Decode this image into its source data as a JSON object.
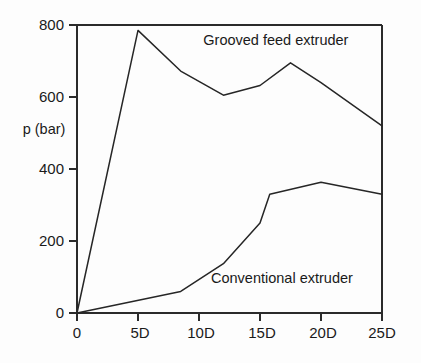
{
  "chart_data": {
    "type": "line",
    "title": "",
    "subtitle": "",
    "xlabel": "",
    "ylabel": "p (bar)",
    "xlim": [
      0,
      25
    ],
    "ylim": [
      0,
      800
    ],
    "grid": false,
    "legend_position": "inline-annotation",
    "x_tick_labels": [
      "0",
      "5D",
      "10D",
      "15D",
      "20D",
      "25D"
    ],
    "x_tick_values": [
      0,
      5,
      10,
      15,
      20,
      25
    ],
    "y_tick_labels": [
      "0",
      "200",
      "400",
      "600",
      "800"
    ],
    "y_tick_values": [
      0,
      200,
      400,
      600,
      800
    ],
    "series": [
      {
        "name": "Grooved feed extruder",
        "x": [
          0,
          5,
          8.5,
          12,
          15,
          17.5,
          20,
          25
        ],
        "values": [
          0,
          785,
          672,
          605,
          632,
          695,
          640,
          520
        ]
      },
      {
        "name": "Conventional extruder",
        "x": [
          0,
          8.5,
          12,
          15,
          15.8,
          20,
          25
        ],
        "values": [
          0,
          60,
          137,
          250,
          330,
          363,
          330
        ]
      }
    ],
    "annotations": [
      {
        "text": "Grooved feed extruder",
        "x": 16.3,
        "y": 745
      },
      {
        "text": "Conventional extruder",
        "x": 16.8,
        "y": 82
      }
    ],
    "colors": {
      "line": "#262626",
      "axis": "#2b2b2b",
      "background": "#fdfdfd",
      "text": "#1a1a1a"
    }
  },
  "axes": {
    "y_axis_title": "p (bar)",
    "y_ticks": [
      {
        "label": "800",
        "value": 800
      },
      {
        "label": "600",
        "value": 600
      },
      {
        "label": "400",
        "value": 400
      },
      {
        "label": "200",
        "value": 200
      },
      {
        "label": "0",
        "value": 0
      }
    ],
    "x_ticks": [
      {
        "label": "0",
        "value": 0
      },
      {
        "label": "5D",
        "value": 5
      },
      {
        "label": "10D",
        "value": 10
      },
      {
        "label": "15D",
        "value": 15
      },
      {
        "label": "20D",
        "value": 20
      },
      {
        "label": "25D",
        "value": 25
      }
    ]
  },
  "labels": {
    "grooved": "Grooved feed extruder",
    "conventional": "Conventional extruder"
  }
}
